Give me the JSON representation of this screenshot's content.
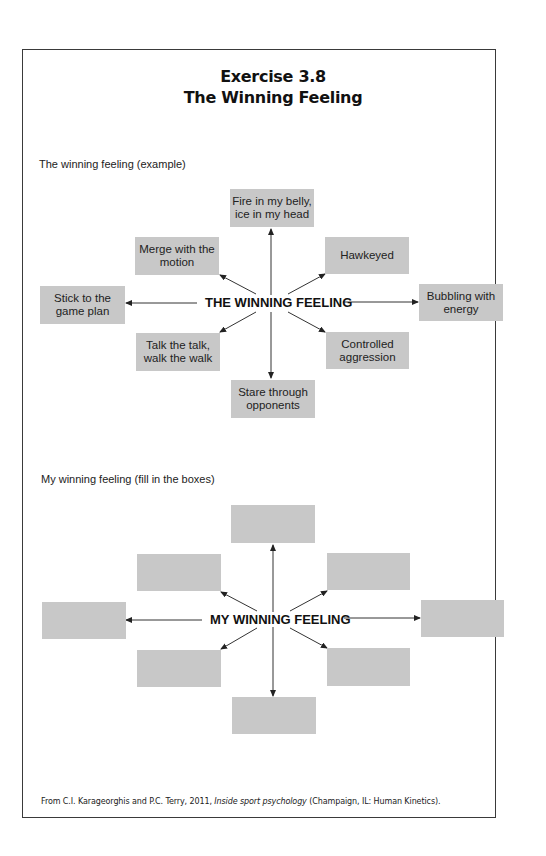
{
  "header": {
    "title_line1": "Exercise 3.8",
    "title_line2": "The Winning Feeling"
  },
  "example": {
    "section_label": "The winning feeling (example)",
    "center_label": "THE WINNING FEELING",
    "boxes": {
      "top": "Fire in my belly, ice in my head",
      "upper_left": "Merge with the motion",
      "upper_right": "Hawkeyed",
      "left": "Stick to the game plan",
      "right": "Bubbling with energy",
      "lower_left": "Talk the talk, walk the walk",
      "lower_right": "Controlled aggression",
      "bottom": "Stare through opponents"
    }
  },
  "mine": {
    "section_label": "My winning feeling (fill in the boxes)",
    "center_label": "MY WINNING FEELING",
    "boxes": {
      "top": "",
      "upper_left": "",
      "upper_right": "",
      "left": "",
      "right": "",
      "lower_left": "",
      "lower_right": "",
      "bottom": ""
    }
  },
  "footer": {
    "prefix": "From C.I. Karageorghis and P.C. Terry, 2011, ",
    "book_title": "Inside sport psychology",
    "suffix": " (Champaign, IL: Human Kinetics)."
  },
  "colors": {
    "box_fill": "#c8c8c8",
    "border": "#3a3a3a",
    "text": "#1a1a1a"
  }
}
